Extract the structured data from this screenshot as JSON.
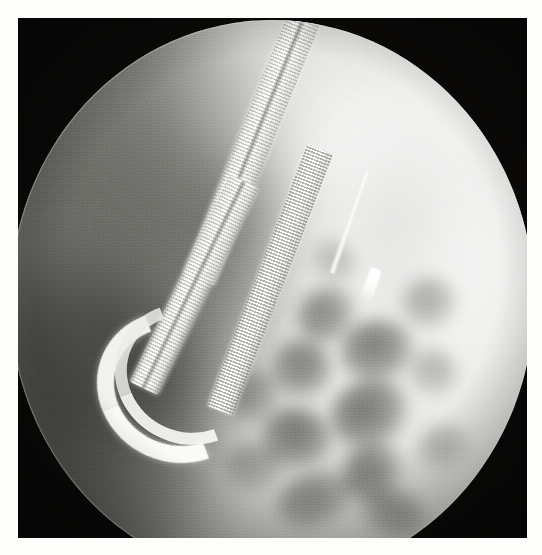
{
  "document": {
    "title": "Fluoroscopic radiograph",
    "modality": "Fluoroscopy",
    "view_shape": "circular collimated field",
    "background_label": "black radiographic background",
    "page_margin_color": "#fdfdfc"
  },
  "colors": {
    "plate_black": "#0a0908",
    "field_bright": "#f3f3f1",
    "field_mid": "#cfcfcb",
    "field_dark": "#8d8d88",
    "device_white": "#ffffff",
    "gas_dark": "#5c5c58"
  },
  "field": {
    "shape": "circle",
    "center_x": 254,
    "center_y": 282,
    "radius": 262,
    "rim_label": "collimator edge"
  },
  "findings": [
    {
      "id": "scope-shaft",
      "label": "endoscope insertion shaft",
      "description": "radiopaque ribbed tube entering from upper right"
    },
    {
      "id": "scope-loop",
      "label": "retroflexion U-turn loop",
      "description": "scope doubles back on itself in lower left quadrant"
    },
    {
      "id": "needle-device",
      "label": "needle / stent device",
      "description": "short bright linear radiopaque device with bulbous tip, right of midline"
    },
    {
      "id": "bowel-gas",
      "label": "gas-filled bowel loops",
      "description": "mottled dark lucencies in right lower field"
    },
    {
      "id": "soft-tissue",
      "label": "soft tissue density",
      "description": "graded grey attenuation, darker toward the left"
    }
  ],
  "gas_blobs": [
    {
      "x": 286,
      "y": 268,
      "w": 62,
      "h": 54,
      "opacity": 0.7
    },
    {
      "x": 330,
      "y": 300,
      "w": 74,
      "h": 62,
      "opacity": 0.78
    },
    {
      "x": 262,
      "y": 320,
      "w": 60,
      "h": 58,
      "opacity": 0.72
    },
    {
      "x": 320,
      "y": 360,
      "w": 80,
      "h": 66,
      "opacity": 0.82
    },
    {
      "x": 252,
      "y": 388,
      "w": 70,
      "h": 60,
      "opacity": 0.76
    },
    {
      "x": 330,
      "y": 424,
      "w": 64,
      "h": 56,
      "opacity": 0.74
    },
    {
      "x": 392,
      "y": 258,
      "w": 54,
      "h": 50,
      "opacity": 0.46
    },
    {
      "x": 398,
      "y": 330,
      "w": 50,
      "h": 46,
      "opacity": 0.4
    },
    {
      "x": 266,
      "y": 452,
      "w": 78,
      "h": 54,
      "opacity": 0.62
    },
    {
      "x": 352,
      "y": 470,
      "w": 66,
      "h": 48,
      "opacity": 0.52
    },
    {
      "x": 216,
      "y": 350,
      "w": 56,
      "h": 50,
      "opacity": 0.5
    },
    {
      "x": 214,
      "y": 424,
      "w": 62,
      "h": 48,
      "opacity": 0.44
    },
    {
      "x": 300,
      "y": 222,
      "w": 48,
      "h": 40,
      "opacity": 0.34
    },
    {
      "x": 408,
      "y": 404,
      "w": 52,
      "h": 44,
      "opacity": 0.36
    }
  ],
  "scope_segments": [
    {
      "id": "upper-shaft",
      "label": "upper scope shaft",
      "x": 228,
      "y": -30,
      "w": 34,
      "h": 300,
      "rot": 22
    },
    {
      "id": "mid-shaft",
      "label": "mid scope shaft",
      "x": 168,
      "y": 150,
      "w": 32,
      "h": 230,
      "rot": 26
    },
    {
      "id": "return-limb",
      "label": "returning scope limb",
      "x": 246,
      "y": 120,
      "w": 28,
      "h": 280,
      "rot": 21
    }
  ],
  "needle": {
    "label": "needle / stent device",
    "shaft": {
      "x": 336,
      "y": 148,
      "w": 7,
      "h": 108,
      "rot": 19
    },
    "tip": {
      "x": 356,
      "y": 248,
      "w": 11,
      "h": 30,
      "rot": 19
    }
  }
}
